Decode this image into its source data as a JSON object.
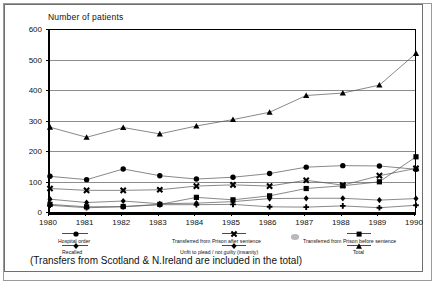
{
  "axis": {
    "y_title": "Number of patients",
    "y_ticks": [
      "600",
      "500",
      "400",
      "300",
      "200",
      "100",
      "0"
    ],
    "x_ticks": [
      "1980",
      "1981",
      "1982",
      "1983",
      "1984",
      "1985",
      "1986",
      "1987",
      "1988",
      "1989",
      "1990"
    ]
  },
  "caption": "(Transfers from Scotland & N.Ireland are included in the total)",
  "legend": {
    "hospital_order": "Hospital order",
    "recalled": "Recalled",
    "after_sentence": "Transferred from Prison after sentence",
    "unfit": "Unfit to plead / not guilty (insanity)",
    "before_sentence": "Transferred from Prison before sentence",
    "total": "Total"
  },
  "chart_data": {
    "type": "line",
    "title": "",
    "xlabel": "",
    "ylabel": "Number of patients",
    "ylim": [
      0,
      600
    ],
    "ytick_step": 100,
    "grid": true,
    "legend_position": "below-axis",
    "x": [
      1980,
      1981,
      1982,
      1983,
      1984,
      1985,
      1986,
      1987,
      1988,
      1989,
      1990
    ],
    "series": [
      {
        "name": "Total",
        "marker": "triangle",
        "values": [
          278,
          245,
          277,
          256,
          282,
          303,
          327,
          382,
          390,
          416,
          520
        ]
      },
      {
        "name": "Hospital order",
        "marker": "circle",
        "values": [
          117,
          106,
          141,
          119,
          108,
          114,
          126,
          147,
          152,
          151,
          140
        ]
      },
      {
        "name": "Transferred from Prison after sentence",
        "marker": "x",
        "values": [
          77,
          71,
          71,
          73,
          85,
          89,
          85,
          104,
          88,
          119,
          143
        ]
      },
      {
        "name": "Transferred from Prison before sentence",
        "marker": "square",
        "values": [
          25,
          17,
          18,
          25,
          48,
          40,
          53,
          77,
          86,
          99,
          181
        ]
      },
      {
        "name": "Recalled",
        "marker": "diamond",
        "values": [
          42,
          31,
          36,
          27,
          29,
          34,
          44,
          45,
          45,
          39,
          44
        ]
      },
      {
        "name": "Unfit to plead / not guilty (insanity)",
        "marker": "plus",
        "values": [
          22,
          14,
          17,
          24,
          24,
          25,
          17,
          16,
          20,
          14,
          22
        ]
      }
    ]
  }
}
